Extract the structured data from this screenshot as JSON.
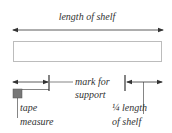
{
  "labels": {
    "length_of_shelf": "length of shelf",
    "mark_for": "mark for",
    "support": "support",
    "tape": "tape",
    "measure": "measure",
    "quarter_length": "¼ length",
    "of_shelf": "of shelf"
  },
  "colors": {
    "line": "#333333",
    "dotted": "#555555",
    "tape_fill": "#777777",
    "background": "#ffffff"
  },
  "icons": {
    "tape_measure": "tape-measure-icon",
    "arrowheads": "arrow-icon"
  }
}
